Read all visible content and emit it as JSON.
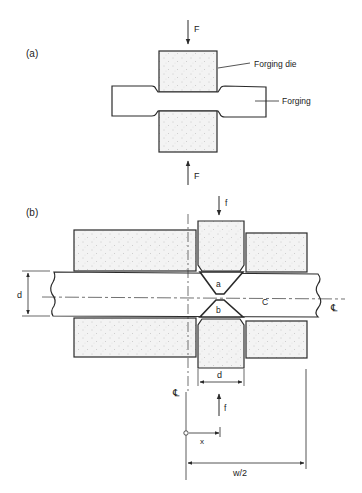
{
  "figure": {
    "panel_a": {
      "label": "(a)",
      "force_top": "F",
      "force_bottom": "F",
      "callouts": {
        "die": "Forging die",
        "forging": "Forging"
      }
    },
    "panel_b": {
      "label": "(b)",
      "force_top": "f",
      "force_bottom": "f",
      "region_a": "a",
      "region_b": "b",
      "region_c": "C",
      "bar_thickness": "d",
      "punch_width": "d",
      "centerline_right": "℄",
      "centerline_vertical": "℄",
      "x_coord": "x",
      "half_width": "w/2"
    }
  }
}
